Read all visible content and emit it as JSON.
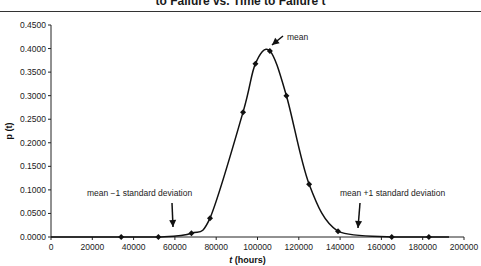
{
  "chart_data": {
    "type": "line",
    "xlabel": "t (hours)",
    "ylabel": "p (t)",
    "xlim": [
      0,
      200000
    ],
    "ylim": [
      0,
      0.45
    ],
    "grid": false,
    "legend": null,
    "x_ticks": [
      "0",
      "20000",
      "40000",
      "60000",
      "80000",
      "100000",
      "120000",
      "140000",
      "160000",
      "180000",
      "200000"
    ],
    "y_ticks": [
      "0.0000",
      "0.0500",
      "0.1000",
      "0.1500",
      "0.2000",
      "0.2500",
      "0.3000",
      "0.3500",
      "0.4000",
      "0.4500"
    ],
    "series": [
      {
        "name": "p(t)",
        "marker": "diamond",
        "smooth": true,
        "x": [
          34000,
          52000,
          68000,
          77000,
          93000,
          99000,
          106000,
          114000,
          125000,
          139000,
          165000,
          183000
        ],
        "y": [
          0.0,
          0.0,
          0.008,
          0.04,
          0.265,
          0.368,
          0.395,
          0.3,
          0.112,
          0.012,
          0.0,
          0.0
        ]
      }
    ],
    "annotations": [
      {
        "text": "mean",
        "target_x": 106000,
        "target_y": 0.395
      },
      {
        "text": "mean −1 standard deviation",
        "target_x": 60000,
        "target_y": 0.0
      },
      {
        "text": "mean +1 standard deviation",
        "target_x": 150000,
        "target_y": 0.0
      }
    ]
  },
  "title": "to Failure vs. Time to Failure t",
  "axes": {
    "xlabel_italic": "t",
    "xlabel_rest": " (hours)",
    "ylabel": "p (t)"
  },
  "annotations": {
    "mean": "mean",
    "minus_sd": "mean −1 standard deviation",
    "plus_sd": "mean +1 standard deviation"
  }
}
